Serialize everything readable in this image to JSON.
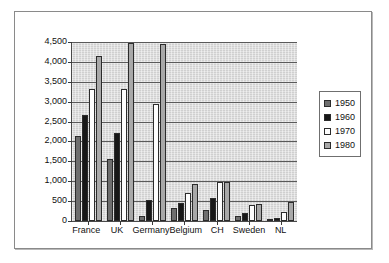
{
  "chart_data": {
    "type": "bar",
    "title": "",
    "xlabel": "",
    "ylabel": "",
    "ylim": [
      0,
      4500
    ],
    "grid": true,
    "legend_position": "right",
    "categories": [
      "France",
      "UK",
      "Germany",
      "Belgium",
      "CH",
      "Sweden",
      "NL"
    ],
    "y_ticks": [
      "0",
      "500",
      "1,000",
      "1,500",
      "2,000",
      "2,500",
      "3,000",
      "3,500",
      "4,000",
      "4,500"
    ],
    "y_tick_values": [
      0,
      500,
      1000,
      1500,
      2000,
      2500,
      3000,
      3500,
      4000,
      4500
    ],
    "series": [
      {
        "name": "1950",
        "color": "#6e6e6e",
        "values": [
          2130,
          1560,
          120,
          330,
          270,
          120,
          60
        ]
      },
      {
        "name": "1960",
        "color": "#171717",
        "values": [
          2660,
          2200,
          530,
          440,
          570,
          190,
          80
        ]
      },
      {
        "name": "1970",
        "color": "#fdfdfd",
        "values": [
          3330,
          3330,
          2950,
          700,
          990,
          400,
          230
        ]
      },
      {
        "name": "1980",
        "color": "#a8a8a8",
        "values": [
          4150,
          4470,
          4450,
          920,
          990,
          430,
          480
        ]
      }
    ]
  }
}
